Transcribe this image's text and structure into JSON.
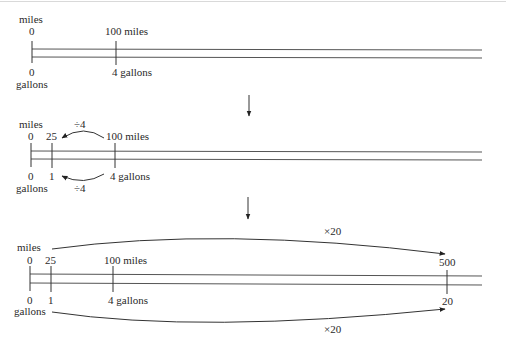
{
  "diagram": {
    "type": "double-number-line",
    "step1": {
      "top_unit": "miles",
      "bottom_unit": "gallons",
      "top_ticks": [
        "0",
        "100 miles"
      ],
      "bottom_ticks": [
        "0",
        "4 gallons"
      ]
    },
    "step2": {
      "top_unit": "miles",
      "bottom_unit": "gallons",
      "top_ticks": [
        "0",
        "25",
        "100 miles"
      ],
      "bottom_ticks": [
        "0",
        "1",
        "4 gallons"
      ],
      "top_operation": "÷4",
      "bottom_operation": "÷4"
    },
    "step3": {
      "top_unit": "miles",
      "bottom_unit": "gallons",
      "top_ticks": [
        "0",
        "25",
        "100 miles",
        "500"
      ],
      "bottom_ticks": [
        "0",
        "1",
        "4 gallons",
        "20"
      ],
      "top_operation": "×20",
      "bottom_operation": "×20"
    }
  }
}
